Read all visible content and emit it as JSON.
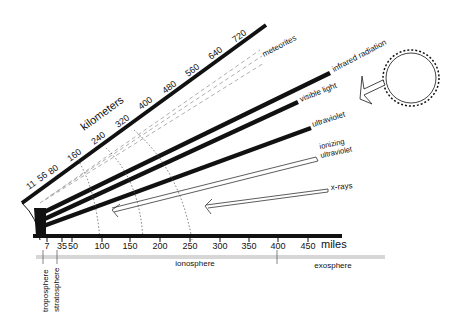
{
  "diagram": {
    "km_axis": {
      "title": "kilometers",
      "ticks": [
        "11",
        "56",
        "80",
        "160",
        "240",
        "320",
        "400",
        "480",
        "560",
        "640",
        "720"
      ]
    },
    "miles_axis": {
      "unit_label": "miles",
      "ticks": [
        "7",
        "35",
        "50",
        "100",
        "150",
        "200",
        "250",
        "300",
        "350",
        "400",
        "450"
      ]
    },
    "rays": [
      {
        "label": "meteorites",
        "style": "dashed"
      },
      {
        "label": "infrared radiation",
        "style": "thick"
      },
      {
        "label": "visible light",
        "style": "thick"
      },
      {
        "label": "ultraviolet",
        "style": "thick"
      },
      {
        "label_line1": "ionizing",
        "label_line2": "ultraviolet",
        "style": "outline"
      },
      {
        "label": "x-rays",
        "style": "outline"
      }
    ],
    "layers": [
      {
        "label": "troposphere"
      },
      {
        "label": "stratosphere"
      },
      {
        "label": "ionosphere"
      },
      {
        "label": "exosphere"
      }
    ],
    "sun": {
      "icon": "sun-icon"
    },
    "colors": {
      "ink": "#111111",
      "dashed": "#999999",
      "background": "#ffffff"
    }
  }
}
